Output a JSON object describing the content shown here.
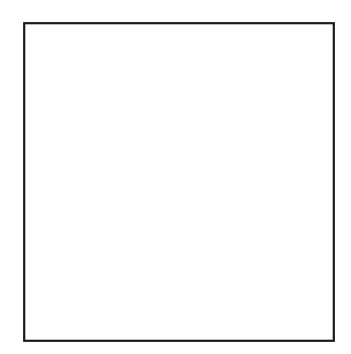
{
  "figure": {
    "kind": "distribution-map",
    "caption": "",
    "background_color": "#ffffff",
    "frame": {
      "x": 23,
      "y": 22,
      "width": 312,
      "height": 320,
      "stroke_color": "#1a1a1a",
      "stroke_width": 2.2
    }
  },
  "legend_patterns": [
    {
      "id": "ocean-stipple",
      "label": "Ocean / water body",
      "description": "Regular widely spaced dot grid",
      "dot_spacing_px": 12,
      "dot_radius_px": 1.25,
      "color": "#2b2b2b"
    },
    {
      "id": "range-stipple",
      "label": "Species range (coastal plain)",
      "description": "Dense fine stipple on land",
      "dot_spacing_px": 5,
      "dot_radius_px": 1.05,
      "color": "#2b2b2b"
    },
    {
      "id": "solid-black",
      "label": "Dense occurrence / record locality",
      "description": "Solid black filled blob",
      "color": "#0d0d0d"
    },
    {
      "id": "unshaded",
      "label": "Absent / not recorded",
      "description": "White, no fill",
      "color": "#ffffff"
    }
  ],
  "map": {
    "region_name": "Southeastern United States",
    "coastline_color": "#111111",
    "coastline_width": 2.6,
    "state_border_color": "#1a1a1a",
    "state_border_width": 1.5,
    "land_fill": "#ffffff"
  },
  "occurrence_marks": [
    {
      "id": "mark-great-lakes-west",
      "shape": "blob",
      "cx": 115,
      "cy": 29,
      "note": "Solid black blob on northern border (west)"
    },
    {
      "id": "mark-great-lakes-east",
      "shape": "blob",
      "cx": 181,
      "cy": 27,
      "note": "Solid black blob on northern border (east)"
    },
    {
      "id": "mark-chesapeake",
      "shape": "shoreline",
      "cx": 288,
      "cy": 72,
      "note": "Dark shoreline band along Chesapeake Bay"
    },
    {
      "id": "mark-outer-banks",
      "shape": "shoreline",
      "cx": 292,
      "cy": 125,
      "note": "Dark patches on Carolina outer coast"
    },
    {
      "id": "mark-florida-interior",
      "shape": "dot",
      "cx": 248,
      "cy": 305,
      "r": 3.6,
      "note": "Isolated black dot in peninsular Florida"
    }
  ],
  "counts": {
    "solid_black_blobs": 2,
    "isolated_black_dots": 1,
    "shaded_range_zones": 1
  }
}
